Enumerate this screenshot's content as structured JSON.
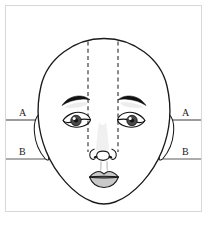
{
  "diagram": {
    "view": "frontal",
    "frame": {
      "visible": true,
      "color": "#d8d8d8",
      "x": 5,
      "y": 5,
      "width": 197,
      "height": 207
    },
    "colors": {
      "outline": "#1a1a1a",
      "guide_line": "#555555",
      "dashed_line": "#2a2a2a",
      "lip_fill": "#c9c9c9",
      "iris_fill": "#4a4a4a",
      "shadow_fill": "#e8e8e8",
      "background": "#ffffff",
      "frame": "#d8d8d8"
    },
    "reference_lines": [
      {
        "id": "A",
        "label_left": "A",
        "label_right": "A",
        "description": "horizontal guide at eye / ear-top level",
        "y": 120,
        "style": "solid-short",
        "segments": "short stubs at left and right margins"
      },
      {
        "id": "B",
        "label_left": "B",
        "label_right": "B",
        "description": "horizontal guide at nose-base / ear-bottom level",
        "y": 159,
        "style": "solid-full",
        "segments": "continuous across full frame width"
      }
    ],
    "vertical_guides": [
      {
        "id": "left-dashed",
        "description": "vertical dashed line from crown through inner eye corner to nostril",
        "x": 88,
        "y_top": 41,
        "y_bottom": 152,
        "style": "dashed"
      },
      {
        "id": "right-dashed",
        "description": "vertical dashed line from crown through inner eye corner to nostril",
        "x": 118,
        "y_top": 41,
        "y_bottom": 152,
        "style": "dashed"
      }
    ],
    "features": [
      {
        "name": "face-oval",
        "label": "Face outline"
      },
      {
        "name": "left-ear",
        "label": "Left ear"
      },
      {
        "name": "right-ear",
        "label": "Right ear"
      },
      {
        "name": "left-eyebrow",
        "label": "Left eyebrow"
      },
      {
        "name": "right-eyebrow",
        "label": "Right eyebrow"
      },
      {
        "name": "left-eye",
        "label": "Left eye"
      },
      {
        "name": "right-eye",
        "label": "Right eye"
      },
      {
        "name": "nose",
        "label": "Nose"
      },
      {
        "name": "mouth",
        "label": "Mouth"
      }
    ]
  }
}
